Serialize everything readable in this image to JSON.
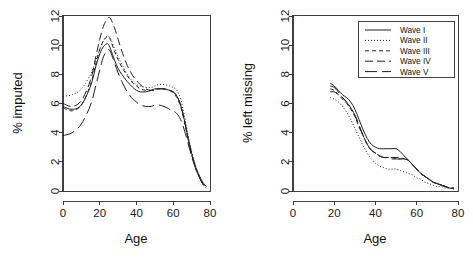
{
  "figure": {
    "background": "#ffffff",
    "ink_color": "#1f1f1f",
    "panels": 2
  },
  "chart_data": [
    {
      "panel": "left",
      "type": "line",
      "title": "",
      "xlabel": "Age",
      "ylabel": "% imputed",
      "xlim": [
        0,
        80
      ],
      "ylim": [
        0,
        12
      ],
      "xticks": [
        0,
        20,
        40,
        60,
        80
      ],
      "yticks": [
        0,
        2,
        4,
        6,
        8,
        10,
        12
      ],
      "xticklabels": [
        "0",
        "20",
        "40",
        "60",
        "80"
      ],
      "yticklabels": [
        "0",
        "2",
        "4",
        "6",
        "8",
        "10",
        "12"
      ],
      "grid": false,
      "legend": "none",
      "x": [
        0,
        5,
        10,
        15,
        18,
        20,
        22,
        24,
        25,
        26,
        28,
        30,
        32,
        35,
        38,
        40,
        42,
        45,
        48,
        50,
        52,
        55,
        58,
        60,
        62,
        64,
        66,
        68,
        70,
        72,
        74,
        76,
        78
      ],
      "series": [
        {
          "name": "Wave I",
          "dash": "solid",
          "values": [
            5.8,
            5.6,
            5.9,
            7.2,
            8.6,
            9.4,
            9.9,
            10.1,
            10.0,
            9.7,
            9.0,
            8.4,
            8.0,
            7.5,
            7.1,
            6.9,
            6.8,
            6.8,
            6.9,
            7.0,
            7.0,
            7.0,
            6.9,
            6.8,
            6.5,
            5.9,
            4.9,
            3.7,
            2.6,
            1.7,
            1.1,
            0.6,
            0.3
          ]
        },
        {
          "name": "Wave II",
          "dash": "dotted",
          "values": [
            6.5,
            6.6,
            7.0,
            8.0,
            9.0,
            9.7,
            10.3,
            10.6,
            10.6,
            10.4,
            9.8,
            9.2,
            8.7,
            8.0,
            7.5,
            7.3,
            7.2,
            7.1,
            7.1,
            7.2,
            7.3,
            7.3,
            7.2,
            7.1,
            6.9,
            6.3,
            5.2,
            3.9,
            2.7,
            1.8,
            1.1,
            0.6,
            0.3
          ]
        },
        {
          "name": "Wave III",
          "dash": "shortdash",
          "values": [
            5.7,
            5.5,
            5.9,
            7.3,
            8.8,
            9.7,
            10.3,
            10.6,
            10.6,
            10.3,
            9.6,
            9.0,
            8.5,
            7.9,
            7.4,
            7.2,
            7.0,
            6.9,
            6.9,
            7.0,
            7.0,
            7.0,
            6.9,
            6.7,
            6.4,
            5.8,
            4.8,
            3.6,
            2.5,
            1.7,
            1.0,
            0.5,
            0.2
          ]
        },
        {
          "name": "Wave IV",
          "dash": "longdash",
          "values": [
            6.0,
            5.8,
            6.2,
            7.6,
            9.3,
            10.4,
            11.3,
            11.8,
            11.9,
            11.8,
            11.2,
            10.4,
            9.6,
            8.6,
            7.9,
            7.6,
            7.3,
            7.0,
            6.9,
            6.9,
            7.0,
            7.0,
            6.9,
            6.8,
            6.5,
            5.9,
            4.9,
            3.6,
            2.5,
            1.6,
            1.0,
            0.5,
            0.2
          ]
        },
        {
          "name": "Wave V",
          "dash": "verylongdash",
          "values": [
            3.8,
            4.0,
            4.6,
            5.9,
            7.3,
            8.3,
            9.2,
            9.6,
            9.7,
            9.5,
            8.8,
            8.1,
            7.5,
            6.8,
            6.3,
            6.1,
            5.9,
            5.8,
            5.8,
            5.9,
            5.9,
            5.8,
            5.6,
            5.5,
            5.3,
            4.9,
            4.2,
            3.3,
            2.4,
            1.6,
            1.0,
            0.5,
            0.2
          ]
        }
      ]
    },
    {
      "panel": "right",
      "type": "line",
      "title": "",
      "xlabel": "Age",
      "ylabel": "% left missing",
      "xlim": [
        0,
        80
      ],
      "ylim": [
        0,
        12
      ],
      "xticks": [
        0,
        20,
        40,
        60,
        80
      ],
      "yticks": [
        0,
        2,
        4,
        6,
        8,
        10,
        12
      ],
      "xticklabels": [
        "0",
        "20",
        "40",
        "60",
        "80"
      ],
      "yticklabels": [
        "0",
        "2",
        "4",
        "6",
        "8",
        "10",
        "12"
      ],
      "grid": false,
      "legend": "upper right",
      "x": [
        18,
        20,
        22,
        24,
        26,
        28,
        30,
        32,
        34,
        36,
        38,
        40,
        42,
        44,
        46,
        48,
        50,
        52,
        54,
        56,
        58,
        60,
        62,
        64,
        66,
        68,
        70,
        72,
        74,
        76,
        78
      ],
      "series": [
        {
          "name": "Wave I",
          "dash": "solid",
          "values": [
            7.4,
            7.2,
            6.9,
            6.6,
            6.4,
            6.1,
            5.6,
            4.9,
            4.2,
            3.6,
            3.2,
            3.0,
            2.9,
            2.9,
            2.9,
            2.9,
            2.9,
            2.7,
            2.4,
            2.1,
            1.8,
            1.5,
            1.2,
            1.0,
            0.8,
            0.6,
            0.5,
            0.4,
            0.3,
            0.2,
            0.2
          ]
        },
        {
          "name": "Wave II",
          "dash": "dotted",
          "values": [
            6.4,
            6.3,
            6.1,
            5.8,
            5.4,
            4.9,
            4.3,
            3.7,
            3.1,
            2.6,
            2.2,
            1.9,
            1.7,
            1.6,
            1.5,
            1.5,
            1.5,
            1.4,
            1.3,
            1.2,
            1.1,
            0.9,
            0.8,
            0.6,
            0.5,
            0.4,
            0.3,
            0.3,
            0.2,
            0.2,
            0.1
          ]
        },
        {
          "name": "Wave III",
          "dash": "shortdash",
          "values": [
            7.0,
            6.9,
            6.6,
            6.3,
            6.0,
            5.6,
            5.1,
            4.4,
            3.8,
            3.2,
            2.8,
            2.6,
            2.4,
            2.3,
            2.3,
            2.2,
            2.2,
            2.2,
            2.2,
            2.1,
            1.8,
            1.5,
            1.2,
            1.0,
            0.8,
            0.6,
            0.5,
            0.4,
            0.3,
            0.2,
            0.2
          ]
        },
        {
          "name": "Wave IV",
          "dash": "longdash",
          "values": [
            6.8,
            6.8,
            6.6,
            6.4,
            6.1,
            5.7,
            5.2,
            4.5,
            3.8,
            3.2,
            2.8,
            2.6,
            2.4,
            2.3,
            2.3,
            2.3,
            2.3,
            2.3,
            2.2,
            2.1,
            1.8,
            1.5,
            1.2,
            1.0,
            0.8,
            0.6,
            0.5,
            0.4,
            0.3,
            0.2,
            0.2
          ]
        },
        {
          "name": "Wave V",
          "dash": "verylongdash",
          "values": [
            7.2,
            7.1,
            6.8,
            6.4,
            6.1,
            5.7,
            5.2,
            4.5,
            3.8,
            3.2,
            2.8,
            2.6,
            2.4,
            2.3,
            2.3,
            2.3,
            2.2,
            2.2,
            2.2,
            2.1,
            1.8,
            1.5,
            1.2,
            1.0,
            0.8,
            0.6,
            0.5,
            0.4,
            0.3,
            0.2,
            0.2
          ]
        }
      ],
      "legend_entries": [
        {
          "label": "Wave I",
          "dash": "solid"
        },
        {
          "label": "Wave II",
          "dash": "dotted"
        },
        {
          "label": "Wave III",
          "dash": "shortdash"
        },
        {
          "label": "Wave IV",
          "dash": "longdash"
        },
        {
          "label": "Wave V",
          "dash": "verylongdash"
        }
      ]
    }
  ]
}
